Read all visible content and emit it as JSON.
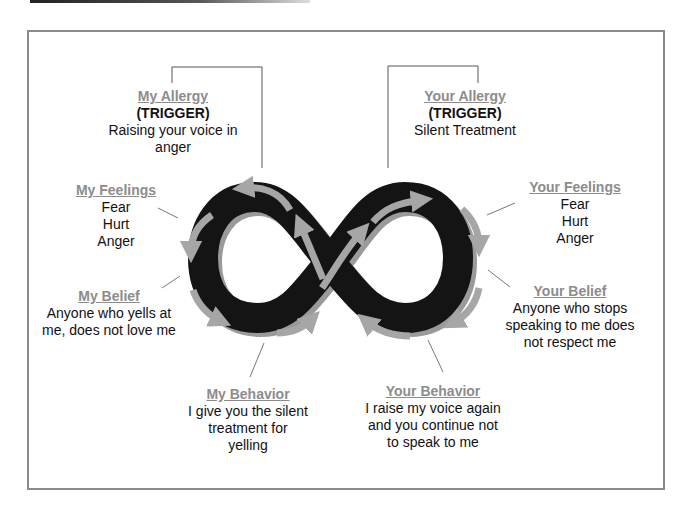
{
  "diagram": {
    "colors": {
      "loop": "#141414",
      "arrow": "#a6a6a6",
      "title": "#8c8c8c",
      "frame": "#8a8a8a",
      "text": "#111111"
    },
    "my_allergy": {
      "title": "My Allergy",
      "trigger": "(TRIGGER)",
      "lines": [
        "Raising your voice in",
        "anger"
      ]
    },
    "your_allergy": {
      "title": "Your Allergy",
      "trigger": "(TRIGGER)",
      "lines": [
        "Silent Treatment"
      ]
    },
    "my_feelings": {
      "title": "My Feelings",
      "lines": [
        "Fear",
        "Hurt",
        "Anger"
      ]
    },
    "your_feelings": {
      "title": "Your Feelings",
      "lines": [
        "Fear",
        "Hurt",
        "Anger"
      ]
    },
    "my_belief": {
      "title": "My Belief",
      "lines": [
        "Anyone who yells at",
        "me, does not love me"
      ]
    },
    "your_belief": {
      "title": "Your Belief",
      "lines": [
        "Anyone who stops",
        "speaking to me does",
        "not respect me"
      ]
    },
    "my_behavior": {
      "title": "My Behavior",
      "lines": [
        "I give you the silent",
        "treatment for",
        "yelling"
      ]
    },
    "your_behavior": {
      "title": "Your Behavior",
      "lines": [
        "I raise my voice again",
        "and you continue not",
        "to speak to me"
      ]
    },
    "center_icon": "infinity-loop-icon"
  }
}
